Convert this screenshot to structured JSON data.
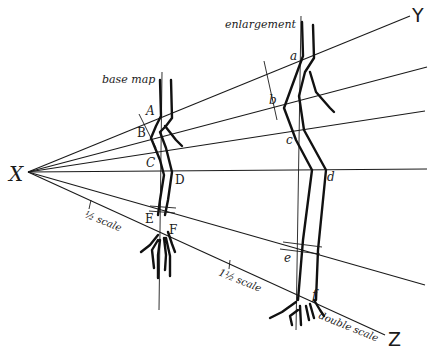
{
  "diagram": {
    "origin_label": "X",
    "ray_labels": {
      "top": "Y",
      "bottom": "Z"
    },
    "base_map": {
      "title": "base map",
      "points": [
        "A",
        "B",
        "C",
        "D",
        "E",
        "F"
      ]
    },
    "enlargement": {
      "title": "enlargement",
      "points": [
        "a",
        "b",
        "c",
        "d",
        "e",
        "f"
      ]
    },
    "scale_marks": {
      "half": "½ scale",
      "one_and_half": "1½ scale",
      "double": "double scale"
    },
    "colors": {
      "ink": "#1a1a1a",
      "paper": "#ffffff"
    }
  }
}
